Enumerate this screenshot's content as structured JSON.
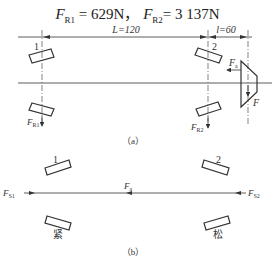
{
  "title": {
    "fr1_symbol": "F",
    "fr1_sub": "R1",
    "fr1_value": "= 629N，",
    "fr2_symbol": "F",
    "fr2_sub": "R2",
    "fr2_value": "= 3 137N"
  },
  "figure_a": {
    "caption": "（a）",
    "dimension_L": "L=120",
    "dimension_l": "l=60",
    "bearing_1_label": "1",
    "bearing_2_label": "2",
    "force_fr1": "F",
    "force_fr1_sub": "R1",
    "force_fr2": "F",
    "force_fr2_sub": "R2",
    "force_fa": "F",
    "force_fa_sub": "a",
    "force_f": "F"
  },
  "figure_b": {
    "caption": "（b）",
    "bearing_1_label": "1",
    "bearing_2_label": "2",
    "force_fs1": "F",
    "force_fs1_sub": "S1",
    "force_fa": "F",
    "force_fa_sub": "a",
    "force_fs2": "F",
    "force_fs2_sub": "S2",
    "left_state": "紧",
    "right_state": "松"
  },
  "colors": {
    "line": "#333333",
    "background": "#ffffff"
  }
}
